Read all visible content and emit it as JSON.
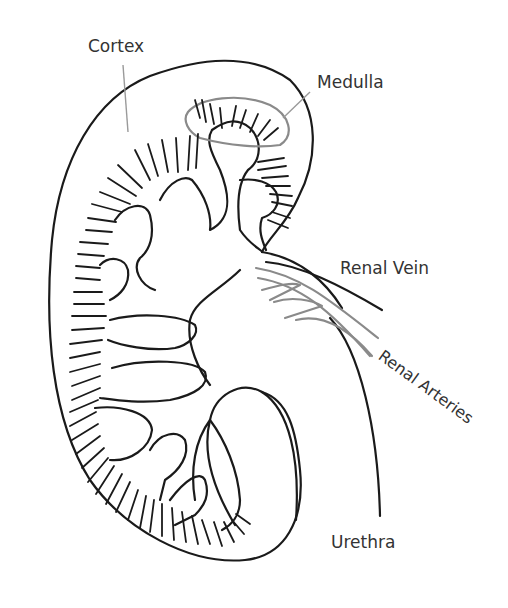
{
  "diagram": {
    "labels": {
      "cortex": "Cortex",
      "medulla": "Medulla",
      "renal_vein": "Renal Vein",
      "renal_arteries": "Renal Arteries",
      "urethra": "Urethra"
    },
    "colors": {
      "outline": "#1a1a1a",
      "vessels_grey": "#8a8a8a",
      "leader_lines": "#9a9a9a",
      "label_text": "#333333",
      "background": "#ffffff"
    }
  }
}
